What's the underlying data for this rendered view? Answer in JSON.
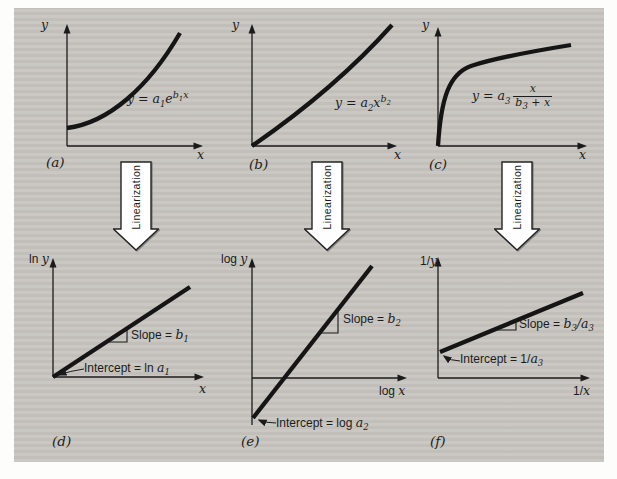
{
  "figure": {
    "colors": {
      "paper": "#fdfdfb",
      "panel_background": "#c8c5c0",
      "ink": "#1c1c1c",
      "arrow_fill": "#ffffff"
    },
    "arrows": [
      {
        "label": "Linearization"
      },
      {
        "label": "Linearization"
      },
      {
        "label": "Linearization"
      }
    ],
    "panels": {
      "a": {
        "caption": "(a)",
        "y_axis_label": "y",
        "x_axis_label": "x",
        "equation": {
          "lead": "y = a",
          "lead_sub": "1",
          "base": "e",
          "sup_var": "b",
          "sup_sub": "1",
          "sup_tail": "x"
        }
      },
      "b": {
        "caption": "(b)",
        "y_axis_label": "y",
        "x_axis_label": "x",
        "equation": {
          "lead": "y = a",
          "lead_sub": "2",
          "base": "x",
          "sup_var": "b",
          "sup_sub": "2",
          "sup_tail": ""
        }
      },
      "c": {
        "caption": "(c)",
        "y_axis_label": "y",
        "x_axis_label": "x",
        "equation": {
          "lead": "y = a",
          "lead_sub": "3",
          "frac_num": "x",
          "den_var": "b",
          "den_sub": "3",
          "den_tail": " + x"
        }
      },
      "d": {
        "caption": "(d)",
        "y_axis_prefix": "ln ",
        "y_axis_var": "y",
        "x_axis_prefix": "",
        "x_axis_var": "x",
        "slope_label": "Slope = ",
        "slope_var": "b",
        "slope_sub": "1",
        "slope_tail": "",
        "slope_tail_sub": "",
        "intercept_label": "Intercept = ln ",
        "intercept_var": "a",
        "intercept_sub": "1"
      },
      "e": {
        "caption": "(e)",
        "y_axis_prefix": "log ",
        "y_axis_var": "y",
        "x_axis_prefix": "log ",
        "x_axis_var": "x",
        "slope_label": "Slope = ",
        "slope_var": "b",
        "slope_sub": "2",
        "slope_tail": "",
        "slope_tail_sub": "",
        "intercept_label": "Intercept = log ",
        "intercept_var": "a",
        "intercept_sub": "2"
      },
      "f": {
        "caption": "(f)",
        "y_axis_prefix": "1/",
        "y_axis_var": "y",
        "x_axis_prefix": "1/",
        "x_axis_var": "x",
        "slope_label": "Slope = ",
        "slope_var": "b",
        "slope_sub": "3",
        "slope_tail": "/a",
        "slope_tail_sub": "3",
        "intercept_label": "Intercept = 1/",
        "intercept_var": "a",
        "intercept_sub": "3"
      }
    }
  }
}
